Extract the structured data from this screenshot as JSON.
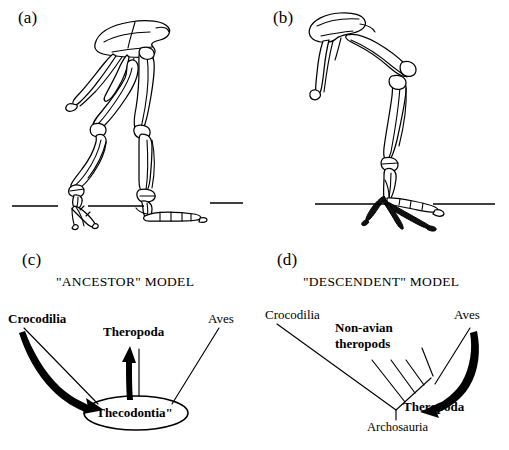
{
  "figure": {
    "caption_style": "four-panel scientific figure",
    "background": "#ffffff",
    "ink": "#000000"
  },
  "panels": [
    {
      "id": "a",
      "label": "(a)",
      "content": "theropod-hindlimb-skeleton",
      "description": "Non-avian theropod pelvis and hindlimb in lateral view standing on ground line"
    },
    {
      "id": "b",
      "label": "(b)",
      "content": "bird-hindlimb-skeleton",
      "description": "Avian pelvis and hindlimb in lateral view standing on ground line"
    },
    {
      "id": "c",
      "label": "(c)",
      "title": "\"ANCESTOR\" MODEL",
      "content": "ancestor-model-diagram",
      "nodes": [
        {
          "name": "Crocodilia",
          "bold": true
        },
        {
          "name": "Theropoda",
          "bold": true
        },
        {
          "name": "Aves",
          "bold": false
        },
        {
          "name": "\"Thecodontia\"",
          "bold": true,
          "shape": "ellipse"
        }
      ]
    },
    {
      "id": "d",
      "label": "(d)",
      "title": "\"DESCENDENT\" MODEL",
      "content": "descendent-model-cladogram",
      "nodes": [
        {
          "name": "Crocodilia",
          "bold": false
        },
        {
          "name": "Non-avian",
          "bold": true
        },
        {
          "name": "theropods",
          "bold": true
        },
        {
          "name": "Aves",
          "bold": false
        },
        {
          "name": "Theropoda",
          "bold": true
        },
        {
          "name": "Archosauria",
          "bold": false
        }
      ]
    }
  ],
  "labels": {
    "panel_a": "(a)",
    "panel_b": "(b)",
    "panel_c": "(c)",
    "panel_d": "(d)",
    "ancestor_model_title": "\"ANCESTOR\" MODEL",
    "descendent_model_title": "\"DESCENDENT\" MODEL",
    "crocodilia_c": "Crocodilia",
    "theropoda_c": "Theropoda",
    "aves_c": "Aves",
    "thecodontia_c": "\"Thecodontia\"",
    "crocodilia_d": "Crocodilia",
    "nonavian_d": "Non-avian",
    "theropods_d": "theropods",
    "aves_d": "Aves",
    "theropoda_d": "Theropoda",
    "archosauria_d": "Archosauria"
  },
  "colors": {
    "ink": "#000000",
    "paper": "#ffffff"
  }
}
